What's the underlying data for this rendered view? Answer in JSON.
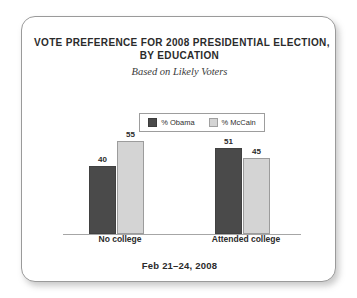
{
  "card": {
    "title_lines": [
      "VOTE PREFERENCE FOR 2008 PRESIDENTIAL ELECTION,",
      "BY EDUCATION"
    ],
    "subtitle": "Based on Likely Voters",
    "footer": "Feb 21–24, 2008"
  },
  "legend": {
    "items": [
      {
        "label": "% Obama",
        "color": "#4a4a4a"
      },
      {
        "label": "% McCain",
        "color": "#d4d4d4"
      }
    ]
  },
  "chart_data": {
    "type": "bar",
    "title": "VOTE PREFERENCE FOR 2008 PRESIDENTIAL ELECTION, BY EDUCATION",
    "subtitle": "Based on Likely Voters",
    "note": "Feb 21–24, 2008",
    "categories": [
      "No college",
      "Attended college"
    ],
    "series": [
      {
        "name": "% Obama",
        "color": "#4a4a4a",
        "values": [
          40,
          51
        ]
      },
      {
        "name": "% McCain",
        "color": "#d4d4d4",
        "values": [
          55,
          45
        ]
      }
    ],
    "xlabel": "",
    "ylabel": "",
    "ylim": [
      0,
      62
    ],
    "grid": false,
    "legend_position": "top-center",
    "value_labels": true
  }
}
